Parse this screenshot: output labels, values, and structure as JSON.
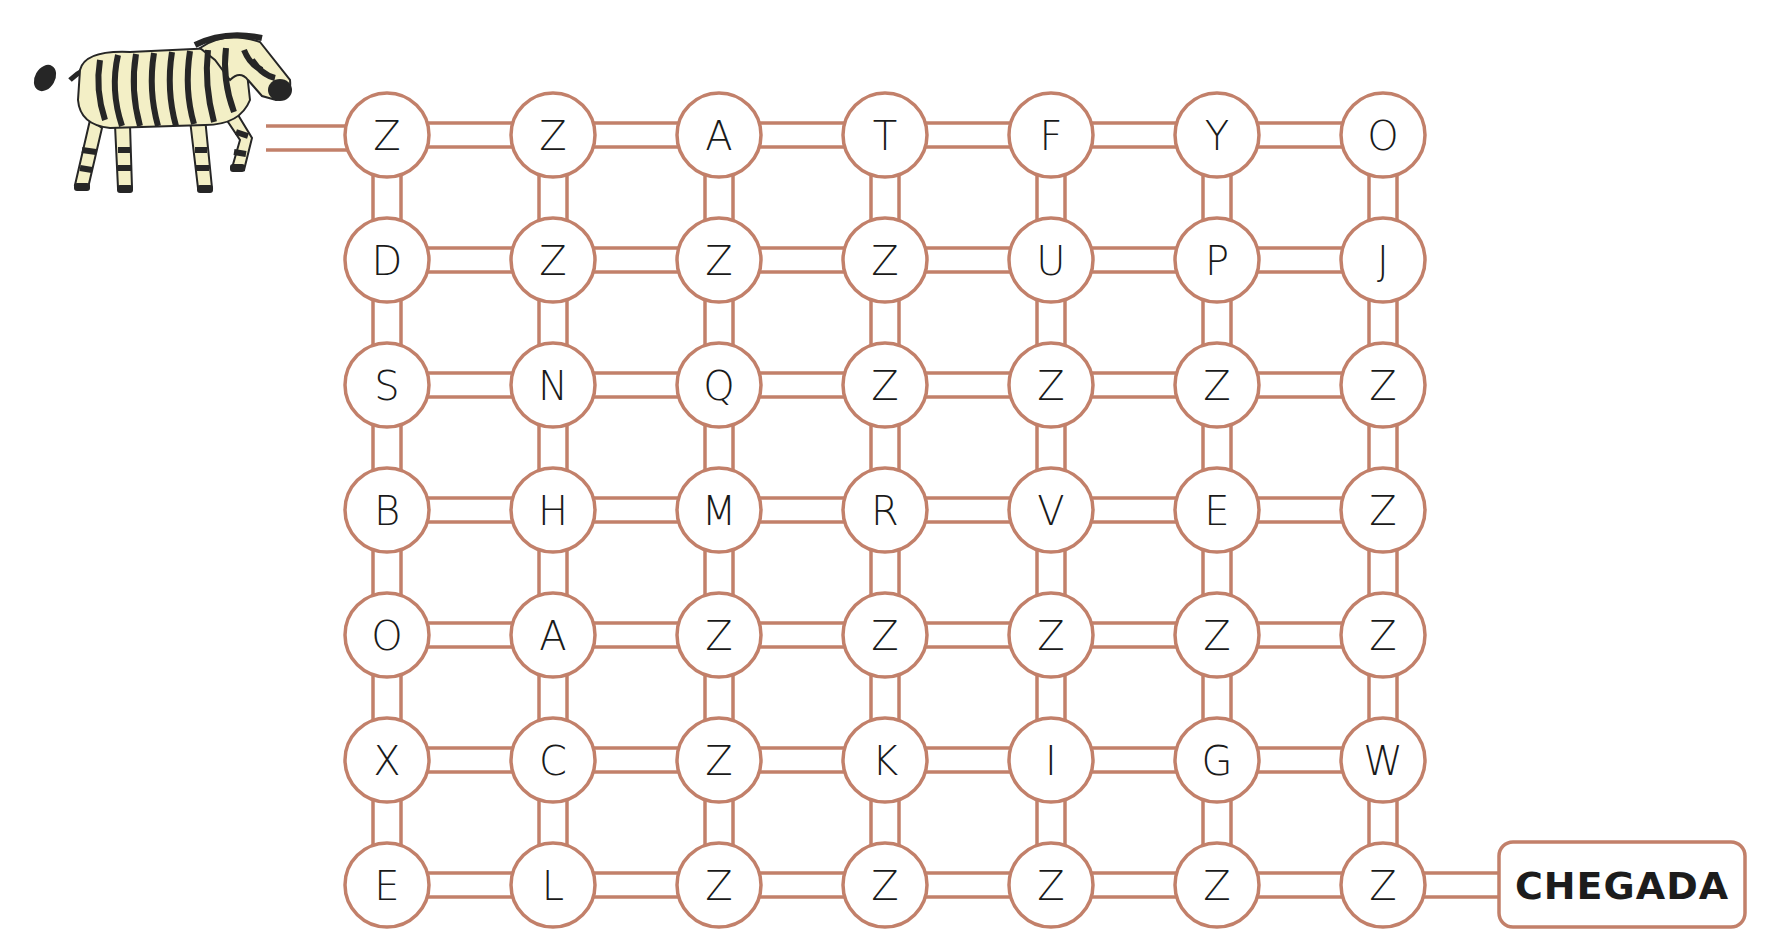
{
  "puzzle": {
    "type": "letter-maze",
    "start": {
      "character": "zebra",
      "icon": "zebra-icon"
    },
    "goal": {
      "label": "CHEGADA"
    },
    "grid": [
      [
        "Z",
        "Z",
        "A",
        "T",
        "F",
        "Y",
        "O"
      ],
      [
        "D",
        "Z",
        "Z",
        "Z",
        "U",
        "P",
        "J"
      ],
      [
        "S",
        "N",
        "Q",
        "Z",
        "Z",
        "Z",
        "Z"
      ],
      [
        "B",
        "H",
        "M",
        "R",
        "V",
        "E",
        "Z"
      ],
      [
        "O",
        "A",
        "Z",
        "Z",
        "Z",
        "Z",
        "Z"
      ],
      [
        "X",
        "C",
        "Z",
        "K",
        "I",
        "G",
        "W"
      ],
      [
        "E",
        "L",
        "Z",
        "Z",
        "Z",
        "Z",
        "Z"
      ]
    ],
    "rows": 7,
    "cols": 7
  },
  "colors": {
    "rail": "#c2806a",
    "node_fill": "#ffffff",
    "letter": "#1a1a1a",
    "zebra_body": "#f3efc6",
    "zebra_stripe": "#262626"
  }
}
